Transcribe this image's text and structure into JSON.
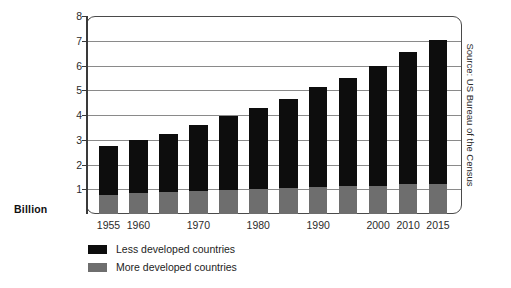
{
  "chart_data": {
    "type": "bar",
    "stacked": true,
    "title": "",
    "subtitle": "",
    "xlabel": "",
    "ylabel": "Billion",
    "ylim": [
      0,
      8
    ],
    "yticks": [
      1,
      2,
      3,
      4,
      5,
      6,
      7,
      8
    ],
    "grid": true,
    "legend_position": "bottom-left",
    "source_note": "Source: US Bureau of the Census",
    "categories": [
      "1955",
      "1960",
      "1965",
      "1970",
      "1975",
      "1980",
      "1985",
      "1990",
      "1995",
      "2000",
      "2010",
      "2015"
    ],
    "tick_labels": [
      "1955",
      "1960",
      "",
      "1970",
      "",
      "1980",
      "",
      "1990",
      "",
      "2000",
      "2010",
      "2015"
    ],
    "series": [
      {
        "name": "More developed countries",
        "color": "#6e6e6e",
        "values": [
          0.78,
          0.83,
          0.88,
          0.92,
          0.96,
          1.0,
          1.04,
          1.08,
          1.12,
          1.15,
          1.2,
          1.22
        ]
      },
      {
        "name": "Less developed countries",
        "color": "#0d0d0d",
        "values": [
          1.97,
          2.17,
          2.37,
          2.68,
          2.99,
          3.3,
          3.61,
          4.07,
          4.38,
          4.85,
          5.35,
          5.83
        ]
      }
    ],
    "totals": [
      2.75,
      3.0,
      3.25,
      3.6,
      3.95,
      4.3,
      4.65,
      5.15,
      5.5,
      6.0,
      6.55,
      7.05
    ]
  },
  "legend": {
    "items": [
      {
        "label": "Less developed countries",
        "color": "#0d0d0d"
      },
      {
        "label": "More developed countries",
        "color": "#6e6e6e"
      }
    ]
  }
}
